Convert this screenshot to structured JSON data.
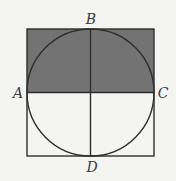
{
  "figure": {
    "type": "circle-inscribed-in-square",
    "square": {
      "x": 27,
      "y": 29,
      "size": 127
    },
    "circle": {
      "cx": 90.5,
      "cy": 92.5,
      "r": 63.5
    },
    "shaded_region": "upper half of square (above diameter AC)",
    "colors": {
      "background": "#f4f4f2",
      "shade": "#737373",
      "stroke": "#2e2e2e"
    }
  },
  "labels": {
    "A": "A",
    "B": "B",
    "C": "C",
    "D": "D"
  }
}
